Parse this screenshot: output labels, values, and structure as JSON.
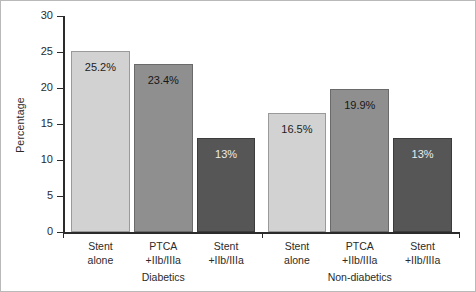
{
  "chart_data": {
    "type": "bar",
    "title": "",
    "subtitle": "",
    "xlabel": "",
    "ylabel": "Percentage",
    "ylim": [
      0,
      30
    ],
    "yticks": [
      0,
      5,
      10,
      15,
      20,
      25,
      30
    ],
    "ytick_labels": [
      "0",
      "5",
      "10",
      "15",
      "20",
      "25",
      "30"
    ],
    "grid": false,
    "legend": false,
    "legend_position": "none",
    "categories": [
      "Stent alone",
      "PTCA +IIb/IIIa",
      "Stent +IIb/IIIa",
      "Stent alone",
      "PTCA +IIb/IIIa",
      "Stent +IIb/IIIa"
    ],
    "values": [
      25.2,
      23.4,
      13.0,
      16.5,
      19.9,
      13.0
    ],
    "data_labels": [
      "25.2%",
      "23.4%",
      "13%",
      "16.5%",
      "19.9%",
      "13%"
    ],
    "groups": [
      "Diabetics",
      "Non-diabetics"
    ],
    "bars": [
      {
        "group": "Diabetics",
        "label_line1": "Stent",
        "label_line2": "alone",
        "value": 25.2,
        "data_label": "25.2%",
        "tone": "tone-light",
        "color": "#d2d2d2"
      },
      {
        "group": "Diabetics",
        "label_line1": "PTCA",
        "label_line2": "+IIb/IIIa",
        "value": 23.4,
        "data_label": "23.4%",
        "tone": "tone-mid",
        "color": "#8f8f8f"
      },
      {
        "group": "Diabetics",
        "label_line1": "Stent",
        "label_line2": "+IIb/IIIa",
        "value": 13.0,
        "data_label": "13%",
        "tone": "tone-dark",
        "color": "#565656"
      },
      {
        "group": "Non-diabetics",
        "label_line1": "Stent",
        "label_line2": "alone",
        "value": 16.5,
        "data_label": "16.5%",
        "tone": "tone-light",
        "color": "#d2d2d2"
      },
      {
        "group": "Non-diabetics",
        "label_line1": "PTCA",
        "label_line2": "+IIb/IIIa",
        "value": 19.9,
        "data_label": "19.9%",
        "tone": "tone-mid",
        "color": "#8f8f8f"
      },
      {
        "group": "Non-diabetics",
        "label_line1": "Stent",
        "label_line2": "+IIb/IIIa",
        "value": 13.0,
        "data_label": "13%",
        "tone": "tone-dark",
        "color": "#565656"
      }
    ],
    "group_labels": [
      {
        "text": "Diabetics"
      },
      {
        "text": "Non-diabetics"
      }
    ],
    "colors": {
      "axis": "#2b2b2b",
      "text": "#2b2b2b",
      "background": "#ffffff",
      "frame": "#b9b9b9",
      "bar_light": "#d2d2d2",
      "bar_mid": "#8f8f8f",
      "bar_dark": "#565656"
    }
  }
}
